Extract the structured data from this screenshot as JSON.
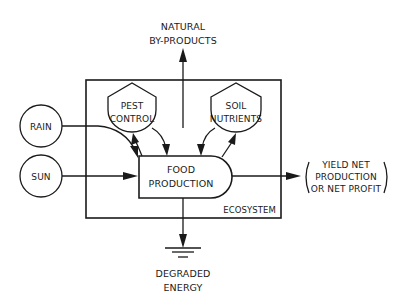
{
  "diagram": {
    "nodes": {
      "rain": {
        "label": "RAIN",
        "shape": "circle"
      },
      "sun": {
        "label": "SUN",
        "shape": "circle"
      },
      "pest_control": {
        "line1": "PEST",
        "line2": "CONTROL",
        "shape": "storage-hexagon"
      },
      "soil_nutrients": {
        "line1": "SOIL",
        "line2": "NUTRIENTS",
        "shape": "storage-hexagon"
      },
      "food_production": {
        "line1": "FOOD",
        "line2": "PRODUCTION",
        "shape": "producer-bullet"
      },
      "ecosystem": {
        "label": "ECOSYSTEM",
        "shape": "rectangle-boundary"
      },
      "natural_byproducts": {
        "line1": "NATURAL",
        "line2": "BY-PRODUCTS"
      },
      "yield": {
        "line1": "YIELD NET",
        "line2": "PRODUCTION",
        "line3": "OR NET PROFIT"
      },
      "degraded_energy": {
        "line1": "DEGRADED",
        "line2": "ENERGY",
        "symbol": "heat-sink-ground"
      }
    },
    "edges": [
      {
        "from": "rain",
        "to": "food_production"
      },
      {
        "from": "sun",
        "to": "food_production"
      },
      {
        "from": "pest_control",
        "to": "food_production"
      },
      {
        "from": "food_production",
        "to": "pest_control"
      },
      {
        "from": "soil_nutrients",
        "to": "food_production"
      },
      {
        "from": "food_production",
        "to": "soil_nutrients"
      },
      {
        "from": "ecosystem",
        "to": "natural_byproducts"
      },
      {
        "from": "food_production",
        "to": "yield"
      },
      {
        "from": "food_production",
        "to": "degraded_energy"
      }
    ],
    "colors": {
      "ink": "#1a1a1a",
      "background": "#ffffff"
    }
  }
}
